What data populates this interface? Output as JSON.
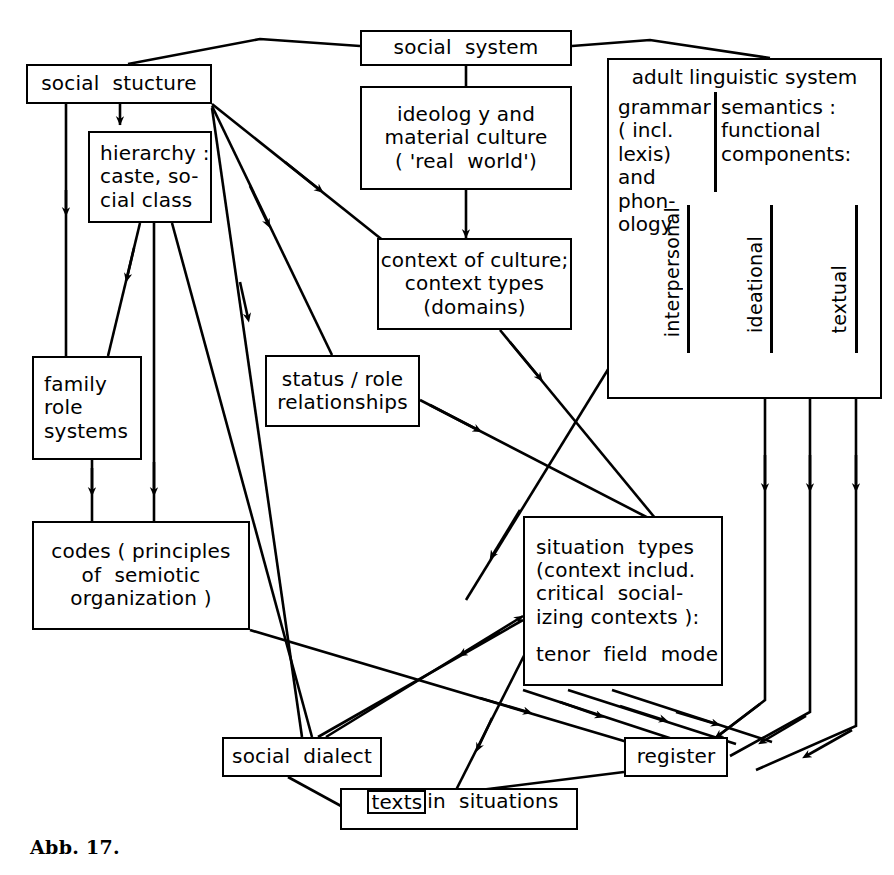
{
  "figure": {
    "caption": "Abb. 17.",
    "stroke_color": "#000000",
    "background_color": "#ffffff"
  },
  "nodes": {
    "social_system": {
      "label": "social  system"
    },
    "social_structure": {
      "label": "social  stucture"
    },
    "hierarchy": {
      "line1": "hierarchy :",
      "line2": "caste, so-",
      "line3": "cial class"
    },
    "family_role_systems": {
      "line1": "family",
      "line2": "role",
      "line3": "systems"
    },
    "codes": {
      "line1": "codes ( principles",
      "line2": "of  semiotic",
      "line3": "organization )"
    },
    "ideology": {
      "line1": "ideolog y and",
      "line2": "material culture",
      "line3": "( 'real  world')"
    },
    "context_of_culture": {
      "line1": "context of culture;",
      "line2": "context types",
      "line3": "(domains)"
    },
    "status_role": {
      "line1": "status / role",
      "line2": "relationships"
    },
    "adult_linguistic_system": {
      "title": "adult  linguistic  system",
      "grammar": {
        "line1": "grammar",
        "line2": "( incl.",
        "line3": "lexis)",
        "line4": "and phon-",
        "line5": "ology"
      },
      "semantics": {
        "line1": "semantics :",
        "line2": "functional",
        "line3": "components:"
      },
      "functional_components": [
        "interpersonal",
        "ideational",
        "textual"
      ]
    },
    "situation_types": {
      "line1": "situation  types",
      "line2": "(context includ.",
      "line3": "critical  social-",
      "line4": "izing contexts ):",
      "line5": "tenor  field  mode"
    },
    "social_dialect": {
      "label": "social  dialect"
    },
    "register": {
      "label": "register"
    },
    "texts_in_situations": {
      "inner": "texts",
      "rest": "in  situations"
    }
  },
  "edges": [
    {
      "from": "social_system",
      "to": "social_structure",
      "style": "plain"
    },
    {
      "from": "social_system",
      "to": "adult_linguistic_system",
      "style": "plain"
    },
    {
      "from": "social_system",
      "to": "ideology",
      "style": "plain"
    },
    {
      "from": "social_structure",
      "to": "hierarchy",
      "style": "arrow"
    },
    {
      "from": "social_structure",
      "to": "family_role_systems",
      "style": "arrow"
    },
    {
      "from": "social_structure",
      "to": "context_of_culture",
      "style": "arrow"
    },
    {
      "from": "social_structure",
      "to": "status_role",
      "style": "arrow"
    },
    {
      "from": "social_structure",
      "to": "social_dialect",
      "style": "arrow"
    },
    {
      "from": "hierarchy",
      "to": "family_role_systems",
      "style": "arrow"
    },
    {
      "from": "hierarchy",
      "to": "codes",
      "style": "arrow"
    },
    {
      "from": "hierarchy",
      "to": "social_dialect",
      "style": "arrow"
    },
    {
      "from": "family_role_systems",
      "to": "codes",
      "style": "arrow"
    },
    {
      "from": "ideology",
      "to": "context_of_culture",
      "style": "arrow"
    },
    {
      "from": "context_of_culture",
      "to": "situation_types",
      "style": "arrow"
    },
    {
      "from": "status_role",
      "to": "situation_types",
      "style": "arrow"
    },
    {
      "from": "adult_linguistic_system",
      "to": "situation_types",
      "style": "arrow"
    },
    {
      "from": "codes",
      "to": "register",
      "style": "arrow"
    },
    {
      "from": "situation_types",
      "to": "social_dialect",
      "style": "arrow"
    },
    {
      "from": "social_dialect",
      "to": "situation_types",
      "style": "arrow"
    },
    {
      "from": "situation_types",
      "to": "texts_in_situations",
      "style": "arrow"
    },
    {
      "from": "situation_types",
      "to": "register",
      "style": "arrow"
    },
    {
      "from": "social_dialect",
      "to": "texts_in_situations",
      "style": "arrow"
    },
    {
      "from": "register",
      "to": "texts_in_situations",
      "style": "arrow"
    },
    {
      "from": "interpersonal",
      "to": "register",
      "style": "arrow"
    },
    {
      "from": "ideational",
      "to": "register",
      "style": "arrow"
    },
    {
      "from": "textual",
      "to": "register",
      "style": "arrow"
    }
  ]
}
